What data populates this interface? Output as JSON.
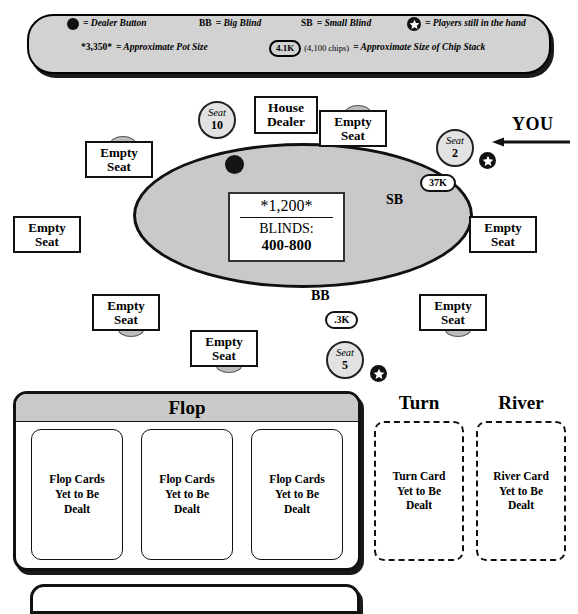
{
  "legend": {
    "row1": [
      {
        "icon": "dealer-button-dot-icon",
        "text": "= Dealer Button"
      },
      {
        "icon": "bb-abbr",
        "abbr": "BB",
        "text": "= Big Blind"
      },
      {
        "icon": "sb-abbr",
        "abbr": "SB",
        "text": "= Small Blind"
      },
      {
        "icon": "star-in-hand-icon",
        "text": "= Players still in the hand"
      }
    ],
    "row2": [
      {
        "abbr": "*3,350*",
        "text": "= Approximate Pot Size"
      },
      {
        "chip": "4.1K",
        "paren": "(4,100 chips)",
        "text": "= Approximate Size of Chip Stack"
      }
    ]
  },
  "table": {
    "pot": {
      "amount": "*1,200*",
      "blinds_label": "BLINDS:",
      "blinds_value": "400-800"
    },
    "positions": {
      "small_blind": "SB",
      "big_blind": "BB"
    },
    "house_dealer_label": "House\nDealer",
    "house_dealer_line1": "House",
    "house_dealer_line2": "Dealer",
    "empty_seat_line1": "Empty",
    "empty_seat_line2": "Seat",
    "seats": [
      {
        "id": "seat-10",
        "word": "Seat",
        "number": "10",
        "occupied": true
      },
      {
        "id": "seat-2",
        "word": "Seat",
        "number": "2",
        "occupied": true,
        "stack": "37K",
        "in_hand": true
      },
      {
        "id": "seat-5",
        "word": "Seat",
        "number": "5",
        "occupied": true,
        "stack": ".3K",
        "in_hand": true
      }
    ],
    "you_pointer": "YOU"
  },
  "board": {
    "flop": {
      "title": "Flop",
      "cards": [
        "Flop Cards Yet to Be Dealt",
        "Flop Cards Yet to Be Dealt",
        "Flop Cards Yet to Be Dealt"
      ],
      "card_line1": "Flop Cards",
      "card_line2": "Yet to Be",
      "card_line3": "Dealt"
    },
    "turn": {
      "title": "Turn",
      "card_line1": "Turn Card",
      "card_line2": "Yet to Be",
      "card_line3": "Dealt"
    },
    "river": {
      "title": "River",
      "card_line1": "River Card",
      "card_line2": "Yet to Be",
      "card_line3": "Dealt"
    }
  },
  "colors": {
    "felt": "#c9c9c9",
    "legend_bg": "#d2d2d2",
    "ink": "#111111"
  }
}
